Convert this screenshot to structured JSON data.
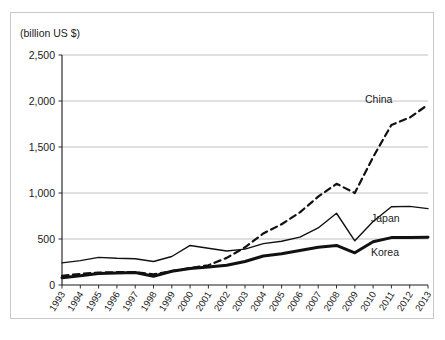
{
  "figure": {
    "units_label": "(billion US $)",
    "title_sliver": "",
    "frame_color": "#c9c9c9",
    "grid_color": "#b0b0b0",
    "axis_color": "#1b1b1b",
    "text_color": "#1b1b1b"
  },
  "chart_data": {
    "type": "line",
    "title": "",
    "subtitle": "",
    "xlabel": "",
    "ylabel": "(billion US $)",
    "ylim": [
      0,
      2500
    ],
    "yticks": [
      0,
      500,
      1000,
      1500,
      2000,
      2500
    ],
    "ytick_labels": [
      "0",
      "500",
      "1,000",
      "1,500",
      "2,000",
      "2,500"
    ],
    "grid": true,
    "grid_axis": "y",
    "legend_position": "inline-right-of-series",
    "x": [
      1993,
      1994,
      1995,
      1996,
      1997,
      1998,
      1999,
      2000,
      2001,
      2002,
      2003,
      2004,
      2005,
      2006,
      2007,
      2008,
      2009,
      2010,
      2011,
      2012,
      2013
    ],
    "categories": [
      "1993",
      "1994",
      "1995",
      "1996",
      "1997",
      "1998",
      "1999",
      "2000",
      "2001",
      "2002",
      "2003",
      "2004",
      "2005",
      "2006",
      "2007",
      "2008",
      "2009",
      "2010",
      "2011",
      "2012",
      "2013"
    ],
    "series": [
      {
        "name": "China",
        "style": "dashed",
        "line_width": 2.2,
        "color": "#111111",
        "values": [
          100,
          120,
          135,
          140,
          140,
          115,
          150,
          185,
          215,
          295,
          410,
          560,
          660,
          790,
          960,
          1100,
          1000,
          1390,
          1740,
          1820,
          1960
        ]
      },
      {
        "name": "Japan",
        "style": "solid-thin",
        "line_width": 1.4,
        "color": "#111111",
        "values": [
          240,
          265,
          300,
          290,
          285,
          255,
          310,
          430,
          400,
          370,
          390,
          450,
          475,
          520,
          620,
          780,
          480,
          690,
          850,
          855,
          830
        ]
      },
      {
        "name": "Korea",
        "style": "solid-thick",
        "line_width": 3.0,
        "color": "#111111",
        "values": [
          80,
          100,
          125,
          130,
          135,
          95,
          150,
          180,
          195,
          215,
          255,
          315,
          340,
          375,
          410,
          430,
          350,
          470,
          515,
          515,
          520
        ]
      }
    ]
  },
  "series_labels": [
    {
      "name": "China"
    },
    {
      "name": "Japan"
    },
    {
      "name": "Korea"
    }
  ]
}
